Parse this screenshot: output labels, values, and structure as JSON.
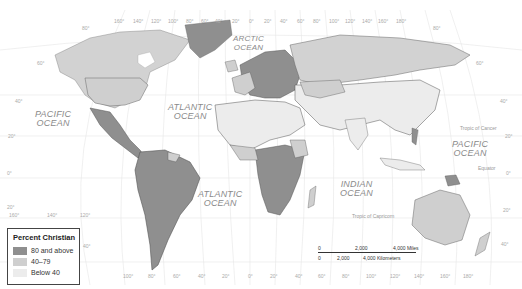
{
  "map": {
    "title": "Percent Christian",
    "colors": {
      "high": "#8f8f8f",
      "mid": "#cfcfcf",
      "low": "#ececec",
      "water": "#ffffff",
      "grid": "#e3e3e3",
      "border": "#555555"
    },
    "oceans": [
      {
        "name": "PACIFIC\nOCEAN",
        "line1": "PACIFIC",
        "line2": "OCEAN"
      },
      {
        "name": "ATLANTIC OCEAN (north)",
        "line1": "ATLANTIC",
        "line2": "OCEAN"
      },
      {
        "name": "ARCTIC OCEAN",
        "line1": "ARCTIC",
        "line2": "OCEAN"
      },
      {
        "name": "PACIFIC OCEAN (east)",
        "line1": "PACIFIC",
        "line2": "OCEAN"
      },
      {
        "name": "ATLANTIC OCEAN (south)",
        "line1": "ATLANTIC",
        "line2": "OCEAN"
      },
      {
        "name": "INDIAN OCEAN",
        "line1": "INDIAN",
        "line2": "OCEAN"
      }
    ],
    "reference_lines": {
      "tropic_of_cancer": "Tropic of Cancer",
      "equator": "Equator",
      "tropic_of_capricorn": "Tropic of Capricorn"
    },
    "top_longitudes": [
      "160°",
      "140°",
      "120°",
      "100°",
      "80°",
      "60°",
      "40°",
      "20°",
      "0°",
      "20°",
      "40°",
      "60°",
      "80°",
      "100°",
      "120°",
      "140°",
      "160°",
      "180°"
    ],
    "bottom_longitudes": [
      "100°",
      "80°",
      "60°",
      "40°",
      "20°",
      "0°",
      "20°",
      "40°",
      "60°",
      "80°",
      "100°",
      "120°",
      "140°",
      "160°",
      "180°"
    ],
    "left_latitudes": [
      "80°",
      "60°",
      "40°",
      "20°",
      "0°",
      "20°",
      "40°"
    ],
    "right_latitudes": [
      "80°",
      "60°",
      "40°",
      "20°",
      "0°",
      "20°",
      "40°"
    ],
    "left_bottom_longitudes": [
      "160°",
      "140°",
      "120°"
    ]
  },
  "legend": {
    "title": "Percent Christian",
    "items": [
      {
        "label": "80 and above",
        "color": "#8f8f8f"
      },
      {
        "label": "40–79",
        "color": "#cfcfcf"
      },
      {
        "label": "Below 40",
        "color": "#ececec"
      }
    ]
  },
  "scale_bar": {
    "miles": [
      "0",
      "2,000",
      "4,000 Miles"
    ],
    "kilometers": [
      "0",
      "2,000",
      "4,000 Kilometers"
    ]
  }
}
